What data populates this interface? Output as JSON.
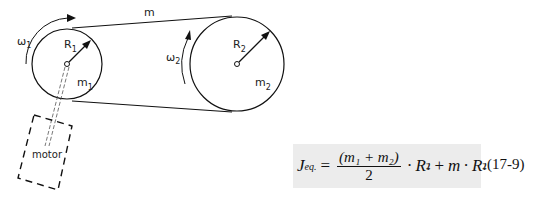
{
  "diagram": {
    "belt_label": "m",
    "pulley1": {
      "omega_label": "ω",
      "omega_sub": "1",
      "radius_label": "R",
      "radius_sub": "1",
      "mass_label": "m",
      "mass_sub": "1"
    },
    "pulley2": {
      "omega_label": "ω",
      "omega_sub": "2",
      "radius_label": "R",
      "radius_sub": "2",
      "mass_label": "m",
      "mass_sub": "2"
    },
    "motor_label": "motor"
  },
  "formula": {
    "lhs": "J",
    "lhs_sub": "eq.",
    "equals": "=",
    "numerator": "(m₁ + m₂)",
    "denominator": "2",
    "dot1": "·",
    "term1": "R",
    "term1_sub": "1",
    "term1_sup": "2",
    "plus": "+",
    "m": "m",
    "dot2": "·",
    "term2": "R",
    "term2_sub": "1",
    "term2_sup": "2",
    "equation_number": "(17-9)"
  }
}
